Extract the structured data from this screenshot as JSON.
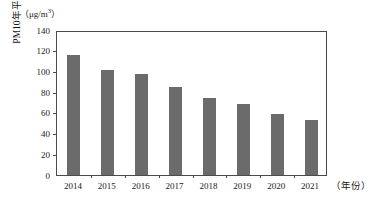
{
  "chart_data": {
    "type": "bar",
    "title": "",
    "subtitle": "",
    "categories": [
      "2014",
      "2015",
      "2016",
      "2017",
      "2018",
      "2019",
      "2020",
      "2021"
    ],
    "values": [
      116,
      101,
      98,
      85,
      74,
      69,
      59,
      53
    ],
    "series": [
      {
        "name": "PM10年平均浓度",
        "values": [
          116,
          101,
          98,
          85,
          74,
          69,
          59,
          53
        ]
      }
    ],
    "xlabel": "（年份）",
    "ylabel": "PM10年平均浓度",
    "yunit_label": "（μg/m³）",
    "yunit_base": "（μg/m",
    "yunit_sup": "3",
    "yunit_close": "）",
    "ylim": [
      0,
      140
    ],
    "ytick_labels": [
      "0",
      "20",
      "40",
      "60",
      "80",
      "100",
      "120",
      "140"
    ],
    "ytick_values": [
      0,
      20,
      40,
      60,
      80,
      100,
      120,
      140
    ],
    "grid": false,
    "legend": "none",
    "bar_color": "#6b6b6b",
    "axis_color": "#4a4a4a",
    "background_color": "#ffffff"
  }
}
